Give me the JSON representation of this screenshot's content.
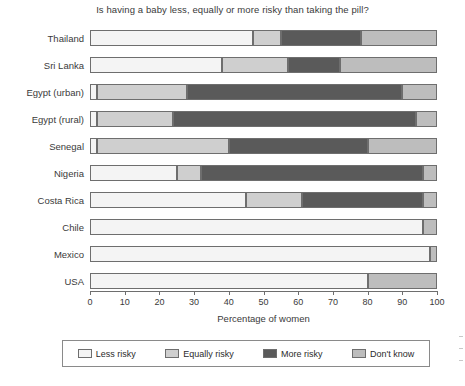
{
  "chart_data": {
    "type": "bar",
    "orientation": "horizontal",
    "stacked": true,
    "title": "Is having a baby less, equally or more risky than taking the pill?",
    "xlabel": "Percentage of women",
    "ylabel": "",
    "xlim": [
      0,
      100
    ],
    "xticks": [
      0,
      10,
      20,
      30,
      40,
      50,
      60,
      70,
      80,
      90,
      100
    ],
    "xtick_labels": [
      "0",
      "10",
      "20",
      "30",
      "40",
      "50",
      "60",
      "70",
      "80",
      "90",
      "100"
    ],
    "grid": false,
    "legend_position": "bottom",
    "categories": [
      "Thailand",
      "Sri Lanka",
      "Egypt (urban)",
      "Egypt (rural)",
      "Senegal",
      "Nigeria",
      "Costa Rica",
      "Chile",
      "Mexico",
      "USA"
    ],
    "series": [
      {
        "name": "Less risky",
        "color": "#f4f4f4",
        "values": [
          47,
          38,
          2,
          2,
          2,
          25,
          45,
          96,
          98,
          80
        ]
      },
      {
        "name": "Equally risky",
        "color": "#cfcfcf",
        "values": [
          8,
          19,
          26,
          22,
          38,
          7,
          16,
          0,
          0,
          0
        ]
      },
      {
        "name": "More risky",
        "color": "#5a5a5a",
        "values": [
          23,
          15,
          62,
          70,
          40,
          64,
          35,
          0,
          0,
          0
        ]
      },
      {
        "name": "Don't know",
        "color": "#bdbdbd",
        "values": [
          22,
          28,
          10,
          6,
          20,
          4,
          4,
          4,
          2,
          20
        ]
      }
    ]
  },
  "legend": {
    "items": [
      {
        "label": "Less risky",
        "color": "#f4f4f4"
      },
      {
        "label": "Equally risky",
        "color": "#cfcfcf"
      },
      {
        "label": "More risky",
        "color": "#5a5a5a"
      },
      {
        "label": "Don't know",
        "color": "#bdbdbd"
      }
    ]
  },
  "colors": {
    "axis": "#6e6e6e",
    "text": "#3a3a3a",
    "background": "#ffffff"
  }
}
